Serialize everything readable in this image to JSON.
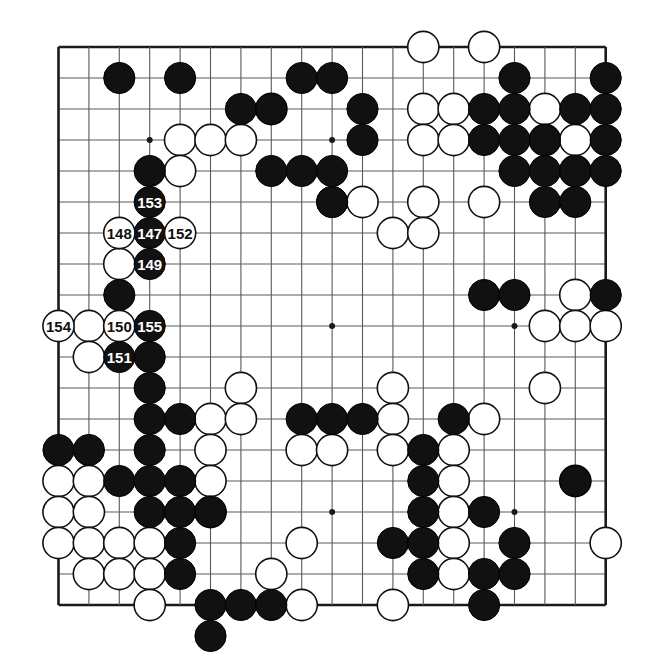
{
  "figure": {
    "kind": "go-game-diagram",
    "board_size": 19,
    "geometry": {
      "origin_x": 58.5,
      "origin_y": 47.0,
      "spacing_x": 30.4,
      "spacing_y": 31.0,
      "stone_radius": 15.6,
      "edge_line_width": 2.6,
      "grid_line_width": 1.1,
      "star_radius": 3.0
    },
    "colors": {
      "background": "#ffffff",
      "grid": "#5a5a5a",
      "edge": "#1a1a1a",
      "black_stone": "#111111",
      "black_stone_edge": "#000000",
      "white_stone": "#ffffff",
      "white_stone_edge": "#111111",
      "black_label_text": "#ffffff",
      "white_label_text": "#111111"
    },
    "star_points": [
      [
        3,
        3
      ],
      [
        9,
        3
      ],
      [
        15,
        3
      ],
      [
        3,
        9
      ],
      [
        9,
        9
      ],
      [
        15,
        9
      ],
      [
        3,
        15
      ],
      [
        9,
        15
      ],
      [
        15,
        15
      ]
    ],
    "label_font_size": 15
  },
  "stones": {
    "black": [
      [
        2,
        1
      ],
      [
        4,
        1
      ],
      [
        8,
        1
      ],
      [
        9,
        1
      ],
      [
        15,
        1
      ],
      [
        18,
        1
      ],
      [
        6,
        2
      ],
      [
        7,
        2
      ],
      [
        10,
        2
      ],
      [
        14,
        2
      ],
      [
        15,
        2
      ],
      [
        17,
        2
      ],
      [
        18,
        2
      ],
      [
        10,
        3
      ],
      [
        14,
        3
      ],
      [
        15,
        3
      ],
      [
        16,
        3
      ],
      [
        18,
        3
      ],
      [
        3,
        4
      ],
      [
        7,
        4
      ],
      [
        8,
        4
      ],
      [
        9,
        4
      ],
      [
        15,
        4
      ],
      [
        16,
        4
      ],
      [
        17,
        4
      ],
      [
        18,
        4
      ],
      [
        9,
        5
      ],
      [
        16,
        5
      ],
      [
        17,
        5
      ],
      [
        3,
        6
      ],
      [
        9,
        5
      ],
      [
        3,
        7
      ],
      [
        2,
        8
      ],
      [
        3,
        9
      ],
      [
        3,
        10
      ],
      [
        14,
        8
      ],
      [
        15,
        8
      ],
      [
        18,
        8
      ],
      [
        3,
        11
      ],
      [
        3,
        12
      ],
      [
        4,
        12
      ],
      [
        8,
        12
      ],
      [
        9,
        12
      ],
      [
        10,
        12
      ],
      [
        13,
        12
      ],
      [
        0,
        13
      ],
      [
        1,
        13
      ],
      [
        3,
        13
      ],
      [
        12,
        13
      ],
      [
        2,
        14
      ],
      [
        3,
        14
      ],
      [
        4,
        14
      ],
      [
        12,
        14
      ],
      [
        17,
        14
      ],
      [
        3,
        15
      ],
      [
        4,
        15
      ],
      [
        5,
        15
      ],
      [
        12,
        15
      ],
      [
        14,
        15
      ],
      [
        4,
        16
      ],
      [
        11,
        16
      ],
      [
        12,
        16
      ],
      [
        15,
        16
      ],
      [
        4,
        17
      ],
      [
        12,
        17
      ],
      [
        14,
        17
      ],
      [
        15,
        17
      ],
      [
        5,
        18
      ],
      [
        6,
        18
      ],
      [
        7,
        18
      ],
      [
        14,
        18
      ]
    ],
    "white": [
      [
        12,
        0
      ],
      [
        14,
        0
      ],
      [
        7,
        2
      ],
      [
        12,
        2
      ],
      [
        13,
        2
      ],
      [
        16,
        2
      ],
      [
        4,
        3
      ],
      [
        5,
        3
      ],
      [
        6,
        3
      ],
      [
        12,
        3
      ],
      [
        13,
        3
      ],
      [
        16,
        3
      ],
      [
        17,
        3
      ],
      [
        4,
        4
      ],
      [
        17,
        4
      ],
      [
        10,
        5
      ],
      [
        12,
        5
      ],
      [
        14,
        5
      ],
      [
        2,
        6
      ],
      [
        11,
        6
      ],
      [
        12,
        6
      ],
      [
        2,
        7
      ],
      [
        17,
        8
      ],
      [
        1,
        9
      ],
      [
        16,
        9
      ],
      [
        17,
        9
      ],
      [
        18,
        9
      ],
      [
        1,
        10
      ],
      [
        2,
        10
      ],
      [
        6,
        11
      ],
      [
        11,
        11
      ],
      [
        16,
        11
      ],
      [
        5,
        12
      ],
      [
        6,
        12
      ],
      [
        11,
        12
      ],
      [
        14,
        12
      ],
      [
        5,
        13
      ],
      [
        8,
        13
      ],
      [
        9,
        13
      ],
      [
        11,
        13
      ],
      [
        13,
        13
      ],
      [
        0,
        14
      ],
      [
        1,
        14
      ],
      [
        5,
        14
      ],
      [
        13,
        14
      ],
      [
        17,
        14
      ],
      [
        0,
        15
      ],
      [
        1,
        15
      ],
      [
        5,
        15
      ],
      [
        13,
        15
      ],
      [
        0,
        16
      ],
      [
        1,
        16
      ],
      [
        2,
        16
      ],
      [
        3,
        16
      ],
      [
        8,
        16
      ],
      [
        13,
        16
      ],
      [
        18,
        16
      ],
      [
        1,
        17
      ],
      [
        2,
        17
      ],
      [
        3,
        17
      ],
      [
        7,
        17
      ],
      [
        13,
        17
      ],
      [
        3,
        18
      ],
      [
        8,
        18
      ],
      [
        11,
        18
      ]
    ]
  },
  "numbered_moves": [
    {
      "n": "147",
      "col": 3,
      "row": 6,
      "color": "black"
    },
    {
      "n": "148",
      "col": 2,
      "row": 6,
      "color": "white"
    },
    {
      "n": "149",
      "col": 3,
      "row": 7,
      "color": "black"
    },
    {
      "n": "150",
      "col": 2,
      "row": 9,
      "color": "white"
    },
    {
      "n": "151",
      "col": 2,
      "row": 10,
      "color": "black"
    },
    {
      "n": "152",
      "col": 4,
      "row": 6,
      "color": "white"
    },
    {
      "n": "153",
      "col": 3,
      "row": 5,
      "color": "black"
    },
    {
      "n": "154",
      "col": 0,
      "row": 9,
      "color": "white"
    },
    {
      "n": "155",
      "col": 3,
      "row": 9,
      "color": "black"
    }
  ],
  "off_board_stones": [
    {
      "col": 5,
      "row": 19,
      "color": "black",
      "note": "stone drawn below bottom edge"
    }
  ],
  "chart_data": {
    "type": "table",
    "categories": [
      "black stones",
      "white stones",
      "numbered moves"
    ],
    "values": [
      72,
      63,
      9
    ],
    "xlabel": "stone type",
    "ylabel": "count"
  }
}
